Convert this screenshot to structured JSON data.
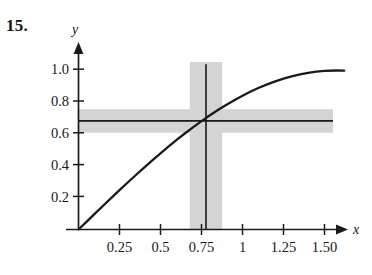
{
  "figure": {
    "problem_number": "15.",
    "background_color": "#ffffff",
    "ink_color": "#1a1a1a",
    "band_color": "#d4d4d4"
  },
  "chart_data": {
    "type": "line",
    "title": "",
    "subtitle": "",
    "xlabel": "x",
    "ylabel": "y",
    "xlim": [
      0,
      1.62
    ],
    "ylim": [
      0,
      1.09
    ],
    "grid": false,
    "legend": null,
    "x_ticks": [
      0.25,
      0.5,
      0.75,
      1,
      1.25,
      1.5
    ],
    "x_tick_labels": [
      "0.25",
      "0.5",
      "0.75",
      "1",
      "1.25",
      "1.50"
    ],
    "y_ticks": [
      0.2,
      0.4,
      0.6,
      0.8,
      1.0
    ],
    "y_tick_labels": [
      "0.2",
      "0.4",
      "0.6",
      "0.8",
      "1.0"
    ],
    "axis_arrows": {
      "x": true,
      "y": true
    },
    "series": [
      {
        "name": "y = sin x",
        "type": "curve",
        "x": [
          0,
          0.05,
          0.1,
          0.15,
          0.2,
          0.25,
          0.3,
          0.35,
          0.4,
          0.45,
          0.5,
          0.55,
          0.6,
          0.65,
          0.7,
          0.75,
          0.7854,
          0.85,
          0.9,
          0.95,
          1.0,
          1.05,
          1.1,
          1.15,
          1.2,
          1.25,
          1.3,
          1.35,
          1.4,
          1.45,
          1.5,
          1.5708,
          1.62
        ],
        "values": [
          0,
          0.05,
          0.0998,
          0.1494,
          0.1987,
          0.2474,
          0.2955,
          0.3429,
          0.3894,
          0.435,
          0.4794,
          0.5227,
          0.5646,
          0.6052,
          0.6442,
          0.6816,
          0.7071,
          0.7513,
          0.7833,
          0.8134,
          0.8415,
          0.8674,
          0.8912,
          0.9128,
          0.932,
          0.949,
          0.9636,
          0.9757,
          0.9854,
          0.9927,
          0.9975,
          1.0,
          0.9988
        ]
      },
      {
        "name": "horizontal target line y = 0.7071",
        "type": "hline",
        "y": 0.7071,
        "x_start": 0,
        "x_end": 1.56
      },
      {
        "name": "vertical target line x = 0.7854",
        "type": "vline",
        "x": 0.7854,
        "y_start": 0,
        "y_end": 1.04
      }
    ],
    "annotations": [
      {
        "name": "horizontal tolerance band",
        "type": "hband",
        "y_center": 0.7071,
        "y_low": 0.6475,
        "y_high": 0.7655,
        "x_start": 0,
        "x_end": 1.56,
        "color": "#d4d4d4"
      },
      {
        "name": "vertical tolerance band",
        "type": "vband",
        "x_center": 0.7854,
        "x_low": 0.6817,
        "x_high": 0.8789,
        "y_start": 0,
        "y_end": 1.015,
        "color": "#d4d4d4"
      }
    ],
    "intersection_point": {
      "x": 0.7854,
      "y": 0.7071
    }
  }
}
